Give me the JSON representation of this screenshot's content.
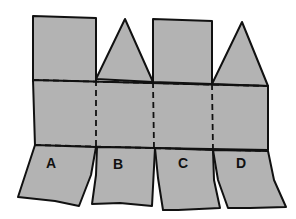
{
  "diagram": {
    "type": "paper-net-with-fold-lines",
    "colors": {
      "fill": "#b3b3b3",
      "stroke": "#111111",
      "background": "#ffffff"
    },
    "top_shapes": [
      {
        "name": "square",
        "column": 1
      },
      {
        "name": "triangle",
        "column": 2
      },
      {
        "name": "square",
        "column": 3
      },
      {
        "name": "triangle",
        "column": 4
      }
    ],
    "fold_lines": [
      "upper-horizontal",
      "lower-horizontal",
      "vertical-dividers"
    ],
    "flaps": [
      {
        "label": "A"
      },
      {
        "label": "B"
      },
      {
        "label": "C"
      },
      {
        "label": "D"
      }
    ]
  }
}
